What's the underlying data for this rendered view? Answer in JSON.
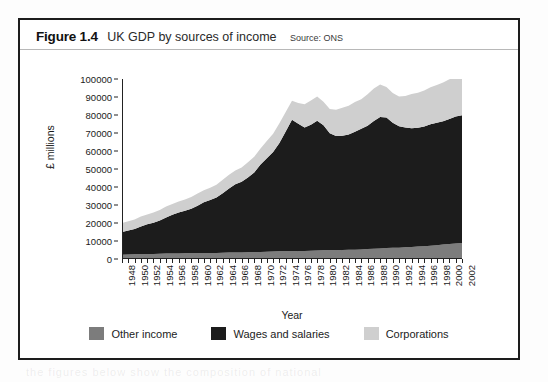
{
  "figure": {
    "number": "Figure 1.4",
    "title": "UK GDP by sources of income",
    "source": "Source: ONS"
  },
  "colors": {
    "other_income": "#7c7c7c",
    "wages_and_salaries": "#1c1c1c",
    "corporations": "#cfcfcf",
    "axis": "#222222",
    "frame": "#1d1d1d"
  },
  "chart_data": {
    "type": "area",
    "stacked": true,
    "title": "UK GDP by sources of income",
    "xlabel": "Year",
    "ylabel": "£ millions",
    "ylim": [
      0,
      100000
    ],
    "ytick_step": 10000,
    "yticks": [
      0,
      10000,
      20000,
      30000,
      40000,
      50000,
      60000,
      70000,
      80000,
      90000,
      100000
    ],
    "ytick_labels": [
      "0",
      "10000",
      "20000",
      "30000",
      "40000",
      "50000",
      "60000",
      "70000",
      "80000",
      "90000",
      "100000"
    ],
    "xlim": [
      1948,
      2002
    ],
    "xtick_step": 1,
    "xtick_label_step": 2,
    "grid": false,
    "legend_position": "bottom",
    "x": [
      1948,
      1949,
      1950,
      1951,
      1952,
      1953,
      1954,
      1955,
      1956,
      1957,
      1958,
      1959,
      1960,
      1961,
      1962,
      1963,
      1964,
      1965,
      1966,
      1967,
      1968,
      1969,
      1970,
      1971,
      1972,
      1973,
      1974,
      1975,
      1976,
      1977,
      1978,
      1979,
      1980,
      1981,
      1982,
      1983,
      1984,
      1985,
      1986,
      1987,
      1988,
      1989,
      1990,
      1991,
      1992,
      1993,
      1994,
      1995,
      1996,
      1997,
      1998,
      1999,
      2000,
      2001,
      2002
    ],
    "xtick_labels": [
      "1948",
      "1950",
      "1952",
      "1954",
      "1956",
      "1958",
      "1960",
      "1962",
      "1964",
      "1966",
      "1968",
      "1970",
      "1972",
      "1974",
      "1976",
      "1978",
      "1980",
      "1982",
      "1984",
      "1986",
      "1988",
      "1990",
      "1992",
      "1994",
      "1996",
      "1998",
      "2000",
      "2002"
    ],
    "series": [
      {
        "name": "Other income",
        "color": "#7c7c7c",
        "values": [
          2400,
          2500,
          2600,
          2700,
          2750,
          2800,
          2900,
          3000,
          3050,
          3100,
          3150,
          3200,
          3250,
          3300,
          3350,
          3400,
          3500,
          3550,
          3600,
          3650,
          3700,
          3800,
          3900,
          4000,
          4100,
          4250,
          4300,
          4350,
          4400,
          4500,
          4600,
          4750,
          4800,
          4850,
          4900,
          5000,
          5100,
          5200,
          5300,
          5500,
          5700,
          5900,
          6100,
          6200,
          6300,
          6500,
          6700,
          6900,
          7100,
          7400,
          7700,
          8000,
          8300,
          8600,
          8900
        ]
      },
      {
        "name": "Wages and salaries",
        "color": "#1c1c1c",
        "values": [
          12600,
          13300,
          14000,
          15300,
          16500,
          17400,
          18500,
          20000,
          21500,
          22700,
          23600,
          24700,
          26300,
          28200,
          29400,
          30700,
          33000,
          35600,
          37900,
          39200,
          41600,
          44300,
          48600,
          52000,
          55300,
          60200,
          66500,
          73000,
          70700,
          68500,
          70000,
          72000,
          69500,
          65000,
          63500,
          63500,
          64000,
          65500,
          67000,
          68500,
          71000,
          73000,
          72500,
          69500,
          67500,
          66500,
          66000,
          66000,
          66500,
          67500,
          68000,
          68500,
          69500,
          70500,
          71000
        ]
      },
      {
        "name": "Corporations",
        "color": "#cfcfcf",
        "values": [
          5000,
          5200,
          5400,
          5600,
          5500,
          5600,
          5800,
          6100,
          6000,
          6200,
          6300,
          6600,
          6800,
          6700,
          6800,
          7100,
          7500,
          7600,
          7700,
          8000,
          8400,
          8700,
          8900,
          9500,
          10200,
          11000,
          10800,
          10500,
          11500,
          13000,
          13500,
          13500,
          13000,
          13500,
          14500,
          15500,
          16000,
          16500,
          16500,
          17500,
          18000,
          18000,
          17000,
          16500,
          16500,
          17500,
          19000,
          19500,
          20000,
          20500,
          21000,
          21500,
          22000,
          22500,
          23000
        ]
      }
    ],
    "totals": [
      20000,
      21000,
      22000,
      23600,
      24750,
      25800,
      27200,
      29100,
      30550,
      32000,
      33050,
      34500,
      36350,
      38200,
      39550,
      41200,
      44000,
      46750,
      49200,
      50850,
      53700,
      56800,
      61400,
      65500,
      69600,
      75450,
      81600,
      87850,
      86600,
      86000,
      88100,
      90250,
      87300,
      83350,
      82900,
      84000,
      85100,
      87200,
      88800,
      91500,
      94700,
      96900,
      95600,
      92200,
      90300,
      90500,
      91700,
      92400,
      93600,
      95400,
      96700,
      98000,
      99800,
      101600,
      102900
    ]
  },
  "legend": {
    "items": [
      {
        "label": "Other income",
        "color": "#7c7c7c"
      },
      {
        "label": "Wages and salaries",
        "color": "#1c1c1c"
      },
      {
        "label": "Corporations",
        "color": "#cfcfcf"
      }
    ]
  }
}
